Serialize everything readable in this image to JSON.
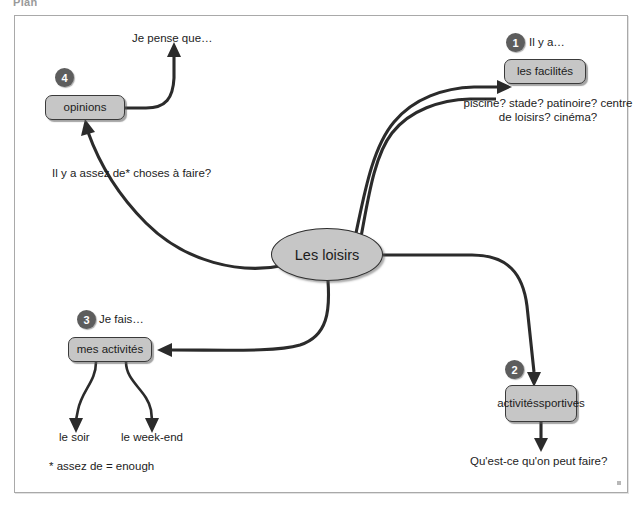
{
  "page": {
    "caption": "Plan"
  },
  "diagram": {
    "title": "Les loisirs",
    "central_node": {
      "label": "Les loisirs"
    },
    "branches": [
      {
        "number": "1",
        "prompt": "Il y a…",
        "node_label": "les facilités",
        "notes": "piscine? stade? patinoire? centre de loisirs? cinéma?"
      },
      {
        "number": "2",
        "prompt": "",
        "node_label": "activités\nsportives",
        "node_label_line1": "activités",
        "node_label_line2": "sportives",
        "notes": "Qu'est-ce qu'on peut faire?"
      },
      {
        "number": "3",
        "prompt": "Je fais…",
        "node_label": "mes activités",
        "sub_labels": [
          "le soir",
          "le week-end"
        ]
      },
      {
        "number": "4",
        "prompt": "",
        "node_label": "opinions",
        "notes": "Je pense que…",
        "question": "Il y a assez de* choses à faire?"
      }
    ],
    "footnote": "* assez de = enough"
  },
  "colors": {
    "node_fill": "#c6c6c6",
    "node_border": "#3a3a3a",
    "badge_fill": "#5d5d5d",
    "badge_text": "#ffffff",
    "connector": "#2b2b2b",
    "frame_border": "#a9a9a9",
    "background": "#ffffff"
  }
}
